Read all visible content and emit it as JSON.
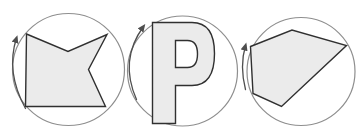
{
  "figure": {
    "background": "#ffffff",
    "colors": {
      "background": "#ffffff",
      "circle_stroke": "#8e8e8e",
      "shape_fill": "#ebebeb",
      "shape_stroke": "#303030",
      "arrow_stroke": "#4e4e4e"
    },
    "panels": [
      {
        "id": "star-polygon",
        "label": "concave hexagon (star-like polygon) inscribed in a circle with clockwise rotation arrow",
        "circle": {
          "cx": 68.5,
          "cy": 69.5,
          "r": 56
        },
        "shape": {
          "type": "polygon",
          "points": "26.5,34 68,51.5 107,34.5 88.5,69.5 105.5,106.5 25.5,106.5"
        },
        "arrow": {
          "path": "M 25.5,108.5 Q 5.5,72 16.5,38",
          "direction": "clockwise"
        }
      },
      {
        "id": "letter-p",
        "label": "block letter P inscribed in a circle with clockwise rotation arrow",
        "circle": {
          "cx": 182.5,
          "cy": 71,
          "r": 55
        },
        "shape": {
          "type": "path",
          "d": "M 152.5,22.5 L 192,22.5 C 207.5,22.5 214.5,33 214.5,53.5 C 214.5,74 207.5,85.5 192,85.5 L 175.5,85.5 L 175.5,123.5 L 152.5,123.5 Z M 175.5,40.5 L 187.5,40.5 C 194.5,40.5 197.5,45 197.5,54 C 197.5,63 194.5,67.5 187.5,67.5 L 175.5,67.5 Z"
        },
        "arrow": {
          "path": "M 136.5,99.5 Q 119,60 143.5,26.5",
          "direction": "clockwise"
        }
      },
      {
        "id": "pentagon",
        "label": "irregular pentagon inscribed in a circle with clockwise rotation arrow",
        "circle": {
          "cx": 301,
          "cy": 71.5,
          "r": 54
        },
        "shape": {
          "type": "polygon",
          "points": "250.5,46.5 292,30 346.5,45.5 281.5,106.5 253,93.5"
        },
        "arrow": {
          "path": "M 245.5,89.5 Q 239.5,66 245.5,45.5",
          "direction": "clockwise"
        }
      }
    ]
  }
}
